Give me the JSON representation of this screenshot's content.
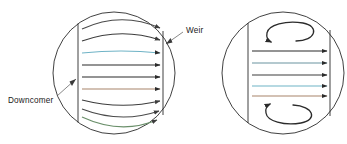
{
  "figure": {
    "background_color": "#ffffff",
    "line_color": "#2b2b2b",
    "label_color": "#1a1a1a",
    "width": 347,
    "height": 144
  },
  "labels": {
    "downcomer": "Downcomer",
    "weir": "Weir"
  },
  "panels": [
    {
      "id": "left-tray",
      "name": "uniform-flow-tray",
      "center_x": 114,
      "center_y": 73,
      "radius": 61,
      "downcomer_x": 78,
      "weir_x": 163,
      "flow_direction": "left-to-right",
      "arrow_count": 9,
      "arrows": [
        {
          "index": 0,
          "y": 25,
          "curve": -17,
          "color": "#4a4a4a"
        },
        {
          "index": 1,
          "y": 36,
          "curve": -12,
          "color": "#3d3d3d"
        },
        {
          "index": 2,
          "y": 52,
          "curve": -2,
          "color": "#5fa8bd"
        },
        {
          "index": 3,
          "y": 64,
          "curve": 0,
          "color": "#2b2b2b"
        },
        {
          "index": 4,
          "y": 76,
          "curve": 0,
          "color": "#2b2b2b"
        },
        {
          "index": 5,
          "y": 88,
          "curve": 0,
          "color": "#b08a6a"
        },
        {
          "index": 6,
          "y": 101,
          "curve": 5,
          "color": "#3d3d3d"
        },
        {
          "index": 7,
          "y": 112,
          "curve": 11,
          "color": "#4a4a4a"
        },
        {
          "index": 8,
          "y": 121,
          "curve": 16,
          "color": "#5a7f5a"
        }
      ],
      "recirculation_zones": []
    },
    {
      "id": "right-tray",
      "name": "recirculation-flow-tray",
      "center_x": 283,
      "center_y": 73,
      "radius": 61,
      "downcomer_x": 248,
      "weir_x": 330,
      "flow_direction": "left-to-right",
      "arrow_count": 5,
      "arrows": [
        {
          "index": 0,
          "y": 51,
          "curve": 0,
          "color": "#2b2b2b"
        },
        {
          "index": 1,
          "y": 63,
          "curve": 0,
          "color": "#5a7f8a"
        },
        {
          "index": 2,
          "y": 75,
          "curve": 0,
          "color": "#3d3d3d"
        },
        {
          "index": 3,
          "y": 86,
          "curve": 0,
          "color": "#5fa8bd"
        },
        {
          "index": 4,
          "y": 96,
          "curve": 0,
          "color": "#b08a6a"
        }
      ],
      "recirculation_zones": [
        {
          "position": "top",
          "rotation": "counterclockwise",
          "cx": 287,
          "cy": 32
        },
        {
          "position": "bottom",
          "rotation": "counterclockwise",
          "cx": 287,
          "cy": 115
        }
      ]
    }
  ],
  "annotations": [
    {
      "name": "downcomer-annotation",
      "text_x": 8,
      "text_y": 102,
      "leader_from_x": 57,
      "leader_from_y": 96,
      "leader_to_x": 75,
      "leader_to_y": 79
    },
    {
      "name": "weir-annotation",
      "text_x": 185,
      "text_y": 32,
      "leader_from_x": 182,
      "leader_from_y": 34,
      "leader_to_x": 165,
      "leader_to_y": 45
    }
  ]
}
